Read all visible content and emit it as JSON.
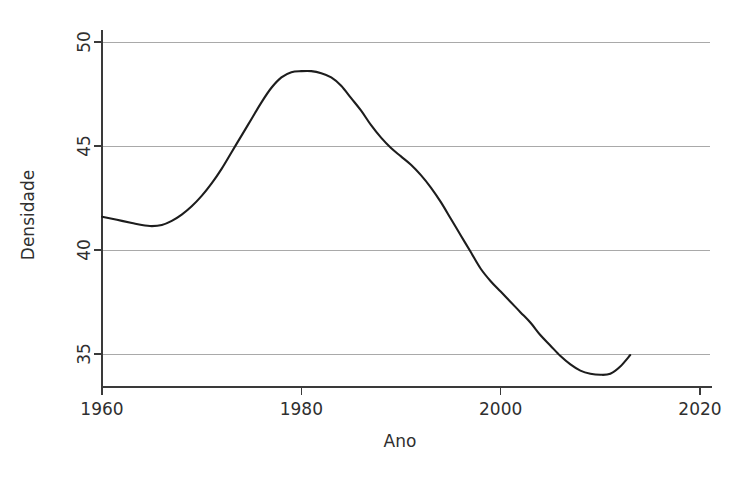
{
  "chart_data": {
    "type": "line",
    "title": "",
    "xlabel": "Ano",
    "ylabel": "Densidade",
    "xlim": [
      1960,
      2020
    ],
    "ylim": [
      33.0,
      50.6
    ],
    "grid": "horizontal",
    "legend": "none",
    "x_ticks": [
      1960,
      1980,
      2000,
      2020
    ],
    "x_tick_labels": [
      "1960",
      "1980",
      "2000",
      "2020"
    ],
    "y_ticks": [
      35,
      40,
      45,
      50
    ],
    "y_tick_labels": [
      "35",
      "40",
      "45",
      "50"
    ],
    "gridlines_y": [
      35,
      40,
      45,
      50
    ],
    "line_color": "#1d1d1d",
    "grid_color": "#a9a9a9",
    "axis_color": "#3a3a3a",
    "background_color": "#ffffff",
    "series": [
      {
        "name": "Densidade",
        "x": [
          1960,
          1961,
          1962,
          1963,
          1964,
          1965,
          1966,
          1967,
          1968,
          1969,
          1970,
          1971,
          1972,
          1973,
          1974,
          1975,
          1976,
          1977,
          1978,
          1979,
          1980,
          1981,
          1982,
          1983,
          1984,
          1985,
          1986,
          1987,
          1988,
          1989,
          1990,
          1991,
          1992,
          1993,
          1994,
          1995,
          1996,
          1997,
          1998,
          1999,
          2000,
          2001,
          2002,
          2003,
          2004,
          2005,
          2006,
          2007,
          2008,
          2009,
          2010,
          2011,
          2012,
          2013
        ],
        "y": [
          41.6,
          41.5,
          41.4,
          41.3,
          41.2,
          41.15,
          41.2,
          41.4,
          41.7,
          42.1,
          42.6,
          43.2,
          43.9,
          44.7,
          45.5,
          46.3,
          47.1,
          47.8,
          48.3,
          48.55,
          48.6,
          48.6,
          48.5,
          48.3,
          47.9,
          47.3,
          46.7,
          46.0,
          45.4,
          44.9,
          44.5,
          44.1,
          43.6,
          43.0,
          42.3,
          41.5,
          40.7,
          39.9,
          39.1,
          38.5,
          38.0,
          37.5,
          37.0,
          36.5,
          35.9,
          35.4,
          34.9,
          34.5,
          34.2,
          34.05,
          34.0,
          34.05,
          34.4,
          34.95
        ]
      }
    ]
  },
  "axis": {
    "y_label": "Densidade",
    "x_label": "Ano"
  }
}
